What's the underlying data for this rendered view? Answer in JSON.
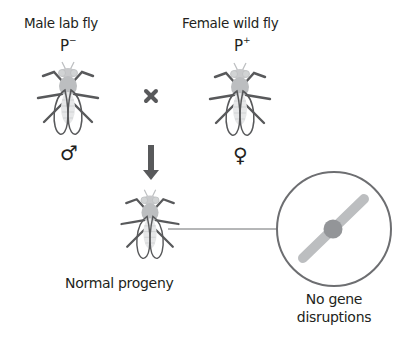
{
  "parents": {
    "male": {
      "label": "Male lab fly",
      "allele_base": "P",
      "allele_sign": "−",
      "sex_symbol": "♂"
    },
    "female": {
      "label": "Female wild fly",
      "allele_base": "P",
      "allele_sign": "+",
      "sex_symbol": "♀"
    }
  },
  "cross_symbol": "×",
  "progeny": {
    "label": "Normal progeny"
  },
  "detail": {
    "label_line1": "No gene",
    "label_line2": "disruptions"
  },
  "colors": {
    "text": "#231f20",
    "outline": "#58595b",
    "fly_body": "#bcbec0",
    "chromosome_arm": "#bcbec0",
    "centromere": "#939598",
    "circle_stroke": "#6d6e71"
  }
}
